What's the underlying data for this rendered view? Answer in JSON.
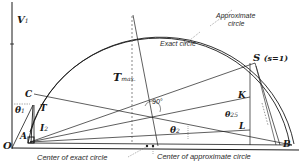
{
  "diagram": {
    "type": "circle-diagram",
    "colors": {
      "line": "#1a1a1a",
      "background": "#ffffff",
      "dashed": "#555555"
    },
    "labels": {
      "v1": "V",
      "v1_sub": "1",
      "tmax": "T",
      "tmax_sub": "max.",
      "approx_circle_line1": "Approximate",
      "approx_circle_line2": "circle",
      "exact_circle": "Exact circle",
      "s_point": "S",
      "s_note": "(s=1)",
      "c_point": "C",
      "theta1": "θ",
      "theta1_sub": "1",
      "t_label": "T",
      "i2": "I",
      "i2_sub": "2",
      "a_point": "A",
      "o_point": "O",
      "angle_90": "90°",
      "k_point": "K",
      "theta25": "θ",
      "theta25_sub": "25",
      "theta2": "θ",
      "theta2_sub": "2",
      "l_point": "L",
      "b_point": "B",
      "center_exact": "Center of exact circle",
      "center_approx": "Center of approximate circle"
    }
  }
}
